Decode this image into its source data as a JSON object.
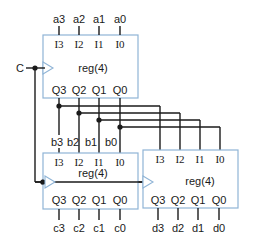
{
  "diagram": {
    "clock_label": "C",
    "registers": [
      {
        "id": "top",
        "name": "reg(4)",
        "inputs": [
          "I3",
          "I2",
          "I1",
          "I0"
        ],
        "outputs": [
          "Q3",
          "Q2",
          "Q1",
          "Q0"
        ],
        "input_signals": [
          "a3",
          "a2",
          "a1",
          "a0"
        ],
        "output_signals": [
          "b3",
          "b2",
          "b1",
          "b0"
        ]
      },
      {
        "id": "bottom-left",
        "name": "reg(4)",
        "inputs": [
          "I3",
          "I2",
          "I1",
          "I0"
        ],
        "outputs": [
          "Q3",
          "Q2",
          "Q1",
          "Q0"
        ],
        "input_signals": [
          "b3",
          "b2",
          "b1",
          "b0"
        ],
        "output_signals": [
          "c3",
          "c2",
          "c1",
          "c0"
        ]
      },
      {
        "id": "bottom-right",
        "name": "reg(4)",
        "inputs": [
          "I3",
          "I2",
          "I1",
          "I0"
        ],
        "outputs": [
          "Q3",
          "Q2",
          "Q1",
          "Q0"
        ],
        "output_signals": [
          "d3",
          "d2",
          "d1",
          "d0"
        ]
      }
    ],
    "colors": {
      "box_border": "#8fb4d6",
      "wire": "#1a1a1a"
    }
  }
}
